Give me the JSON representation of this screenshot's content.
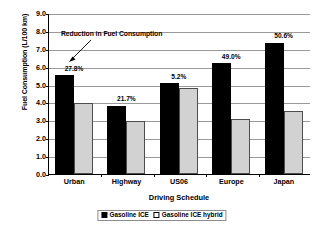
{
  "chart_data": {
    "type": "bar",
    "title": "",
    "xlabel": "Driving Schedule",
    "ylabel": "Fuel Consumption (L/100 km)",
    "categories": [
      "Urban",
      "Highway",
      "US06",
      "Europe",
      "Japan"
    ],
    "series": [
      {
        "name": "Gasoline ICE",
        "color": "#000000",
        "values": [
          5.52,
          3.82,
          5.08,
          6.2,
          7.35
        ]
      },
      {
        "name": "Gasoline ICE hybrid",
        "color": "#d2d2d2",
        "values": [
          3.98,
          2.95,
          4.82,
          3.1,
          3.5
        ]
      }
    ],
    "point_labels": [
      "27.8%",
      "21.7%",
      "5.2%",
      "49.0%",
      "50.6%"
    ],
    "ylim": [
      0.0,
      9.0
    ],
    "ytick_step": 1.0,
    "yticks": [
      "0.0",
      "1.0",
      "2.0",
      "3.0",
      "4.0",
      "5.0",
      "6.0",
      "7.0",
      "8.0",
      "9.0"
    ],
    "grid": "horizontal",
    "legend_position": "bottom",
    "annotations": [
      {
        "text": "Reduction in Fuel Consumption",
        "arrow": "down-left"
      }
    ]
  }
}
